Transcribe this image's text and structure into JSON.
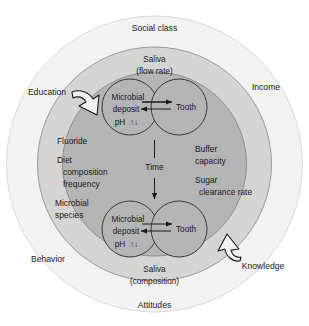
{
  "figure": {
    "type": "concentric-circles-diagram",
    "background": "#ffffff",
    "colors": {
      "outer_ring_fill": "#f2f2f2",
      "middle_ring_fill": "#d4d4d4",
      "core_circle_fill": "#b4b4b4",
      "stroke": "#9a9a9a",
      "text": "#1a1a1a",
      "arrow": "#1a1a1a"
    }
  },
  "outer_ring": {
    "name": "outer-ring",
    "labels": [
      {
        "id": "social-class",
        "text": "Social class"
      },
      {
        "id": "income",
        "text": "Income"
      },
      {
        "id": "knowledge",
        "text": "Knowledge"
      },
      {
        "id": "attitudes",
        "text": "Attitudes"
      },
      {
        "id": "behavior",
        "text": "Behavior"
      },
      {
        "id": "education",
        "text": "Education"
      }
    ]
  },
  "middle_ring": {
    "name": "middle-ring",
    "left_labels": [
      {
        "id": "fluoride",
        "text": "Fluoride"
      },
      {
        "id": "diet",
        "text": "Diet"
      },
      {
        "id": "diet-composition",
        "text": "composition"
      },
      {
        "id": "diet-frequency",
        "text": "frequency"
      },
      {
        "id": "microbial",
        "text": "Microbial"
      },
      {
        "id": "microbial-species",
        "text": "species"
      }
    ],
    "right_labels": [
      {
        "id": "buffer",
        "text": "Buffer"
      },
      {
        "id": "buffer-capacity",
        "text": "capacity"
      },
      {
        "id": "sugar",
        "text": "Sugar"
      },
      {
        "id": "sugar-clearance-rate",
        "text": "clearance rate"
      }
    ]
  },
  "core_top": {
    "name": "core-top",
    "caption_line1": "Saliva",
    "caption_line2": "(flow rate)",
    "left_circle": {
      "line1": "Microbial",
      "line2": "deposit",
      "line3_label": "pH",
      "line3_symbol": "↑↓"
    },
    "right_circle": {
      "label": "Tooth"
    }
  },
  "core_bottom": {
    "name": "core-bottom",
    "caption_line1": "Saliva",
    "caption_line2": "(composition)",
    "left_circle": {
      "line1": "Microbial",
      "line2": "deposit",
      "line3_label": "pH",
      "line3_symbol": "↑↓"
    },
    "right_circle": {
      "label": "Tooth"
    }
  },
  "time_axis": {
    "name": "time-axis",
    "label": "Time",
    "direction": "down"
  },
  "inbound_arrows": [
    {
      "id": "education-arrow",
      "points_to": "middle-ring",
      "from": "Education"
    },
    {
      "id": "knowledge-arrow",
      "points_to": "middle-ring",
      "from": "Knowledge"
    }
  ]
}
